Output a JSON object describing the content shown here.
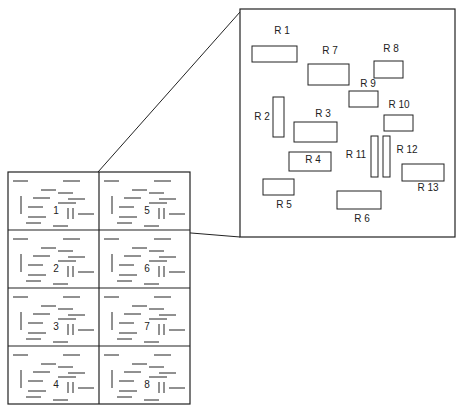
{
  "zoom_panel": {
    "regions": [
      {
        "label": "R 1",
        "x": 252,
        "y": 46,
        "w": 45,
        "h": 16,
        "lx": 282,
        "ly": 34
      },
      {
        "label": "R 7",
        "x": 308,
        "y": 64,
        "w": 41,
        "h": 21,
        "lx": 330,
        "ly": 54
      },
      {
        "label": "R 8",
        "x": 374,
        "y": 61,
        "w": 29,
        "h": 17,
        "lx": 391,
        "ly": 52
      },
      {
        "label": "R 9",
        "x": 349,
        "y": 91,
        "w": 29,
        "h": 16,
        "lx": 368,
        "ly": 87
      },
      {
        "label": "R 2",
        "x": 273,
        "y": 97,
        "w": 11,
        "h": 40,
        "lx": 262,
        "ly": 120
      },
      {
        "label": "R 3",
        "x": 294,
        "y": 122,
        "w": 43,
        "h": 20,
        "lx": 323,
        "ly": 117
      },
      {
        "label": "R 10",
        "x": 384,
        "y": 115,
        "w": 29,
        "h": 16,
        "lx": 399,
        "ly": 108
      },
      {
        "label": "R 11",
        "x": 371,
        "y": 136,
        "w": 7,
        "h": 41,
        "lx": 356,
        "ly": 158
      },
      {
        "label": "R 12",
        "x": 383,
        "y": 136,
        "w": 7,
        "h": 41,
        "lx": 407,
        "ly": 153
      },
      {
        "label": "R 4",
        "x": 289,
        "y": 152,
        "w": 42,
        "h": 19,
        "lx": 313,
        "ly": 163
      },
      {
        "label": "R 13",
        "x": 402,
        "y": 164,
        "w": 42,
        "h": 17,
        "lx": 428,
        "ly": 191
      },
      {
        "label": "R 5",
        "x": 263,
        "y": 179,
        "w": 31,
        "h": 16,
        "lx": 284,
        "ly": 208
      },
      {
        "label": "R 6",
        "x": 337,
        "y": 191,
        "w": 44,
        "h": 18,
        "lx": 362,
        "ly": 222
      }
    ]
  },
  "board_grid": {
    "cells": [
      {
        "number": "1",
        "col": 0,
        "row": 0
      },
      {
        "number": "5",
        "col": 1,
        "row": 0
      },
      {
        "number": "2",
        "col": 0,
        "row": 1
      },
      {
        "number": "6",
        "col": 1,
        "row": 1
      },
      {
        "number": "3",
        "col": 0,
        "row": 2
      },
      {
        "number": "7",
        "col": 1,
        "row": 2
      },
      {
        "number": "4",
        "col": 0,
        "row": 3
      },
      {
        "number": "8",
        "col": 1,
        "row": 3
      }
    ]
  }
}
